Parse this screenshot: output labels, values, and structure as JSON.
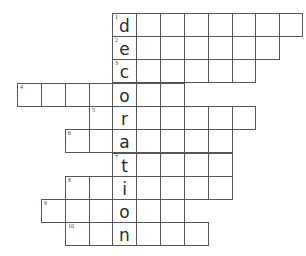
{
  "puzzle": {
    "type": "crossword",
    "vertical_word": "decoration",
    "col_edges": [
      17,
      41,
      65,
      89,
      112,
      136,
      160,
      184,
      208,
      232,
      255,
      279,
      302
    ],
    "rows": [
      {
        "number": "1",
        "top": 13,
        "height": 24,
        "start_col": 4,
        "cells": 8,
        "letter_col": 4,
        "letter": "d"
      },
      {
        "number": "2",
        "top": 36,
        "height": 24,
        "start_col": 4,
        "cells": 7,
        "letter_col": 4,
        "letter": "e"
      },
      {
        "number": "3",
        "top": 59,
        "height": 24,
        "start_col": 4,
        "cells": 6,
        "letter_col": 4,
        "letter": "c"
      },
      {
        "number": "4",
        "top": 83,
        "height": 24,
        "start_col": 0,
        "cells": 7,
        "letter_col": 4,
        "letter": "o"
      },
      {
        "number": "5",
        "top": 106,
        "height": 24,
        "start_col": 3,
        "cells": 7,
        "letter_col": 4,
        "letter": "r"
      },
      {
        "number": "6",
        "top": 129,
        "height": 24,
        "start_col": 2,
        "cells": 7,
        "letter_col": 4,
        "letter": "a"
      },
      {
        "number": "7",
        "top": 153,
        "height": 24,
        "start_col": 4,
        "cells": 5,
        "letter_col": 4,
        "letter": "t"
      },
      {
        "number": "8",
        "top": 176,
        "height": 24,
        "start_col": 2,
        "cells": 7,
        "letter_col": 4,
        "letter": "i"
      },
      {
        "number": "9",
        "top": 199,
        "height": 24,
        "start_col": 1,
        "cells": 6,
        "letter_col": 4,
        "letter": "o"
      },
      {
        "number": "10",
        "top": 222,
        "height": 24,
        "start_col": 2,
        "cells": 6,
        "letter_col": 4,
        "letter": "n"
      }
    ]
  }
}
